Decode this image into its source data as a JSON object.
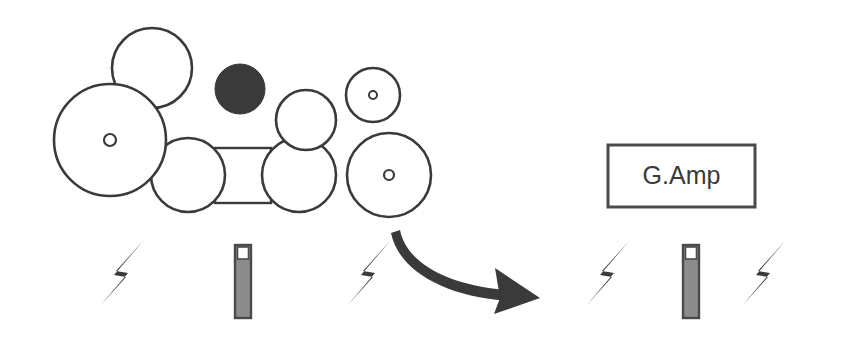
{
  "diagram": {
    "title": "",
    "background_color": "#ffffff",
    "stroke_color": "#3a3a3a",
    "fill_white": "#ffffff",
    "fill_dark": "#3a3a3a",
    "fill_gray": "#8c8c8c",
    "box": {
      "label": "G.Amp",
      "x": 608,
      "y": 145,
      "width": 147,
      "height": 62,
      "text_color": "#3a3a3a",
      "border_color": "#4a4a4a"
    },
    "circles": [
      {
        "name": "top-left-circle",
        "cx": 152,
        "cy": 68,
        "r": 40,
        "fill": "#ffffff",
        "hub": false
      },
      {
        "name": "large-left-circle",
        "cx": 110,
        "cy": 140,
        "r": 56,
        "fill": "#ffffff",
        "hub": true,
        "hub_r": 6
      },
      {
        "name": "dark-circle",
        "cx": 240,
        "cy": 89,
        "r": 25,
        "fill": "#3a3a3a",
        "hub": false
      },
      {
        "name": "lower-left-circle",
        "cx": 188,
        "cy": 175,
        "r": 37,
        "fill": "#ffffff",
        "hub": false
      },
      {
        "name": "upper-middle-circle",
        "cx": 306,
        "cy": 120,
        "r": 30,
        "fill": "#ffffff",
        "hub": false
      },
      {
        "name": "lower-middle-circle",
        "cx": 299,
        "cy": 175,
        "r": 37,
        "fill": "#ffffff",
        "hub": false
      },
      {
        "name": "small-hub-circle",
        "cx": 373,
        "cy": 95,
        "r": 27,
        "fill": "#ffffff",
        "hub": true,
        "hub_r": 4
      },
      {
        "name": "right-hub-circle",
        "cx": 389,
        "cy": 175,
        "r": 42,
        "fill": "#ffffff",
        "hub": true,
        "hub_r": 5
      }
    ],
    "connector_rect": {
      "name": "axle-rectangle",
      "x": 215,
      "y": 148,
      "width": 56,
      "height": 55
    },
    "bolts": [
      {
        "name": "bolt-1",
        "cx": 122,
        "cy": 273,
        "scale": 1.0,
        "flip": false
      },
      {
        "name": "bolt-2",
        "cx": 369,
        "cy": 273,
        "scale": 1.0,
        "flip": false
      },
      {
        "name": "bolt-3",
        "cx": 608,
        "cy": 273,
        "scale": 1.0,
        "flip": false
      },
      {
        "name": "bolt-4",
        "cx": 764,
        "cy": 273,
        "scale": 1.0,
        "flip": false
      }
    ],
    "bars": [
      {
        "name": "indicator-bar-left",
        "x": 235,
        "y": 245,
        "width": 16,
        "height": 73,
        "cap_height": 14
      },
      {
        "name": "indicator-bar-right",
        "x": 683,
        "y": 245,
        "width": 16,
        "height": 73,
        "cap_height": 14
      }
    ],
    "arrow": {
      "name": "curved-arrow",
      "description": "curved arrow from lower-left to right",
      "color": "#3a3a3a"
    }
  }
}
